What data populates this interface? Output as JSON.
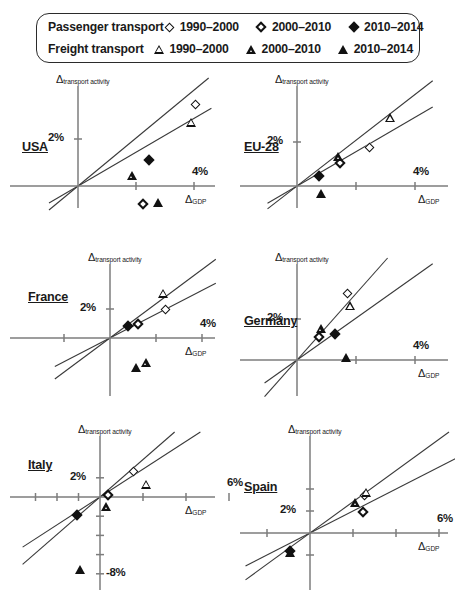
{
  "legend": {
    "rows": [
      {
        "category": "Passenger transport",
        "marker_family": "diamond",
        "items": [
          {
            "label": "1990–2000",
            "marker": "diamond-open-icon"
          },
          {
            "label": "2000–2010",
            "marker": "diamond-half-icon"
          },
          {
            "label": "2010–2014",
            "marker": "diamond-solid-icon"
          }
        ]
      },
      {
        "category": "Freight transport",
        "marker_family": "triangle",
        "items": [
          {
            "label": "1990–2000",
            "marker": "triangle-open-icon"
          },
          {
            "label": "2000–2010",
            "marker": "triangle-half-icon"
          },
          {
            "label": "2010–2014",
            "marker": "triangle-solid-icon"
          }
        ]
      }
    ]
  },
  "axis_labels": {
    "y_delta": "Δ",
    "y_sub": "transport activity",
    "x_delta": "Δ",
    "x_sub": "GDP"
  },
  "chart_data": [
    {
      "type": "scatter",
      "title": "USA",
      "xlabel": "ΔGDP",
      "ylabel": "Δtransport activity",
      "xlim": [
        -1.0,
        4.6
      ],
      "ylim": [
        -1.3,
        4.2
      ],
      "xticks": [
        2,
        4
      ],
      "xticklabels": [
        "",
        "4%"
      ],
      "yticks": [
        2
      ],
      "yticklabels": [
        "2%"
      ],
      "grid": false,
      "legend_position": "external-top",
      "series": [
        {
          "name": "Passenger transport 1990–2000",
          "marker": "diamond-open",
          "x": 4.05,
          "y": 3.45
        },
        {
          "name": "Passenger transport 2000–2010",
          "marker": "diamond-half",
          "x": 2.25,
          "y": -0.75
        },
        {
          "name": "Passenger transport 2010–2014",
          "marker": "diamond-solid",
          "x": 2.45,
          "y": 1.1
        },
        {
          "name": "Freight transport 1990–2000",
          "marker": "triangle-open",
          "x": 3.9,
          "y": 2.7
        },
        {
          "name": "Freight transport 2000–2010",
          "marker": "triangle-half",
          "x": 1.85,
          "y": 0.45
        },
        {
          "name": "Freight transport 2010–2014",
          "marker": "triangle-solid",
          "x": 2.75,
          "y": -0.7
        }
      ],
      "fit_lines": [
        {
          "name": "steep",
          "slope": 1.02,
          "intercept": 0
        },
        {
          "name": "shallow",
          "slope": 0.72,
          "intercept": 0
        }
      ]
    },
    {
      "type": "scatter",
      "title": "EU-28",
      "xlabel": "ΔGDP",
      "ylabel": "Δtransport activity",
      "xlim": [
        -1.0,
        4.6
      ],
      "ylim": [
        -1.3,
        4.2
      ],
      "xticks": [
        2,
        4
      ],
      "xticklabels": [
        "",
        "4%"
      ],
      "yticks": [
        2
      ],
      "yticklabels": [
        "2%"
      ],
      "grid": false,
      "legend_position": "external-top",
      "series": [
        {
          "name": "Passenger transport 1990–2000",
          "marker": "diamond-open",
          "x": 2.45,
          "y": 1.75
        },
        {
          "name": "Passenger transport 2000–2010",
          "marker": "diamond-half",
          "x": 1.45,
          "y": 1.05
        },
        {
          "name": "Passenger transport 2010–2014",
          "marker": "diamond-solid",
          "x": 0.75,
          "y": 0.45
        },
        {
          "name": "Freight transport 1990–2000",
          "marker": "triangle-open",
          "x": 3.15,
          "y": 3.1
        },
        {
          "name": "Freight transport 2000–2010",
          "marker": "triangle-half",
          "x": 1.4,
          "y": 1.35
        },
        {
          "name": "Freight transport 2010–2014",
          "marker": "triangle-solid",
          "x": 0.8,
          "y": -0.35
        }
      ],
      "fit_lines": [
        {
          "name": "steep",
          "slope": 1.04,
          "intercept": 0
        },
        {
          "name": "shallow",
          "slope": 0.78,
          "intercept": 0
        }
      ]
    },
    {
      "type": "scatter",
      "title": "France",
      "xlabel": "ΔGDP",
      "ylabel": "Δtransport activity",
      "xlim": [
        -2.4,
        4.6
      ],
      "ylim": [
        -2.6,
        3.8
      ],
      "xticks": [
        -2,
        2,
        4
      ],
      "xticklabels": [
        "",
        "",
        "4%"
      ],
      "yticks": [
        2
      ],
      "yticklabels": [
        "2%"
      ],
      "grid": false,
      "legend_position": "external-top",
      "series": [
        {
          "name": "Passenger transport 1990–2000",
          "marker": "diamond-open",
          "x": 2.4,
          "y": 1.95
        },
        {
          "name": "Passenger transport 2000–2010",
          "marker": "diamond-half",
          "x": 1.2,
          "y": 1.0
        },
        {
          "name": "Passenger transport 2010–2014",
          "marker": "diamond-solid",
          "x": 0.8,
          "y": 0.85
        },
        {
          "name": "Freight transport 1990–2000",
          "marker": "triangle-open",
          "x": 2.3,
          "y": 3.1
        },
        {
          "name": "Freight transport 2000–2010",
          "marker": "triangle-half",
          "x": 1.55,
          "y": -1.7
        },
        {
          "name": "Freight transport 2010–2014",
          "marker": "triangle-solid",
          "x": 1.15,
          "y": -2.05
        }
      ],
      "fit_lines": [
        {
          "name": "steep",
          "slope": 1.18,
          "intercept": 0
        },
        {
          "name": "shallow",
          "slope": 0.82,
          "intercept": 0
        }
      ]
    },
    {
      "type": "scatter",
      "title": "Germany",
      "xlabel": "ΔGDP",
      "ylabel": "Δtransport activity",
      "xlim": [
        -1.1,
        4.6
      ],
      "ylim": [
        -1.6,
        4.0
      ],
      "xticks": [
        2,
        4
      ],
      "xticklabels": [
        "",
        "4%"
      ],
      "yticks": [
        2
      ],
      "yticklabels": [
        "2%"
      ],
      "grid": false,
      "legend_position": "external-top",
      "series": [
        {
          "name": "Passenger transport 1990–2000",
          "marker": "diamond-open",
          "x": 1.7,
          "y": 3.25
        },
        {
          "name": "Passenger transport 2000–2010",
          "marker": "diamond-half",
          "x": 0.75,
          "y": 1.1
        },
        {
          "name": "Passenger transport 2010–2014",
          "marker": "diamond-solid",
          "x": 1.3,
          "y": 1.25
        },
        {
          "name": "Freight transport 1990–2000",
          "marker": "triangle-open",
          "x": 1.8,
          "y": 2.65
        },
        {
          "name": "Freight transport 2000–2010",
          "marker": "triangle-half",
          "x": 0.8,
          "y": 1.55
        },
        {
          "name": "Freight transport 2010–2014",
          "marker": "triangle-solid",
          "x": 1.65,
          "y": 0.1
        }
      ],
      "fit_lines": [
        {
          "name": "steep",
          "slope": 1.62,
          "intercept": 0
        },
        {
          "name": "shallow",
          "slope": 1.02,
          "intercept": 0
        }
      ]
    },
    {
      "type": "scatter",
      "title": "Italy",
      "xlabel": "ΔGDP",
      "ylabel": "Δtransport activity",
      "xlim": [
        -3.6,
        6.8
      ],
      "ylim": [
        -9.6,
        4.0
      ],
      "xticks": [
        -3,
        -2,
        -1,
        2,
        4,
        6
      ],
      "xticklabels": [
        "",
        "",
        "",
        "",
        "",
        "6%"
      ],
      "yticks": [
        2,
        -2,
        -4,
        -6,
        -8
      ],
      "yticklabels": [
        "2%",
        "",
        "",
        "",
        "-8%"
      ],
      "grid": false,
      "legend_position": "external-top",
      "series": [
        {
          "name": "Passenger transport 1990–2000",
          "marker": "diamond-open",
          "x": 1.55,
          "y": 2.7
        },
        {
          "name": "Passenger transport 2000–2010",
          "marker": "diamond-half",
          "x": 0.35,
          "y": 0.25
        },
        {
          "name": "Passenger transport 2010–2014",
          "marker": "diamond-solid",
          "x": -1.05,
          "y": -1.85
        },
        {
          "name": "Freight transport 1990–2000",
          "marker": "triangle-open",
          "x": 2.15,
          "y": 1.35
        },
        {
          "name": "Freight transport 2000–2010",
          "marker": "triangle-half",
          "x": 0.3,
          "y": -0.95
        },
        {
          "name": "Freight transport 2010–2014",
          "marker": "triangle-solid",
          "x": -0.95,
          "y": -7.55
        }
      ],
      "fit_lines": [
        {
          "name": "steep",
          "slope": 1.95,
          "intercept": 0
        },
        {
          "name": "shallow",
          "slope": 1.45,
          "intercept": 0
        }
      ]
    },
    {
      "type": "scatter",
      "title": "Spain",
      "xlabel": "ΔGDP",
      "ylabel": "Δtransport activity",
      "xlim": [
        -3.0,
        7.0
      ],
      "ylim": [
        -4.4,
        5.0
      ],
      "xticks": [
        -2,
        2,
        4,
        6
      ],
      "xticklabels": [
        "",
        "",
        "",
        "6%"
      ],
      "yticks": [
        2,
        4,
        -2
      ],
      "yticklabels": [
        "2%",
        "",
        ""
      ],
      "grid": false,
      "legend_position": "external-top",
      "series": [
        {
          "name": "Passenger transport 1990–2000",
          "marker": "diamond-open",
          "x": 2.55,
          "y": 3.45
        },
        {
          "name": "Passenger transport 2000–2010",
          "marker": "diamond-half",
          "x": 2.45,
          "y": 1.95
        },
        {
          "name": "Passenger transport 2010–2014",
          "marker": "diamond-solid",
          "x": -0.95,
          "y": -1.6
        },
        {
          "name": "Freight transport 1990–2000",
          "marker": "triangle-open",
          "x": 2.6,
          "y": 3.7
        },
        {
          "name": "Freight transport 2000–2010",
          "marker": "triangle-half",
          "x": 2.1,
          "y": 2.8
        },
        {
          "name": "Freight transport 2010–2014",
          "marker": "triangle-solid",
          "x": -0.95,
          "y": -1.75
        }
      ],
      "fit_lines": [
        {
          "name": "steep",
          "slope": 1.42,
          "intercept": 0
        },
        {
          "name": "shallow",
          "slope": 1.0,
          "intercept": 0
        }
      ]
    }
  ]
}
